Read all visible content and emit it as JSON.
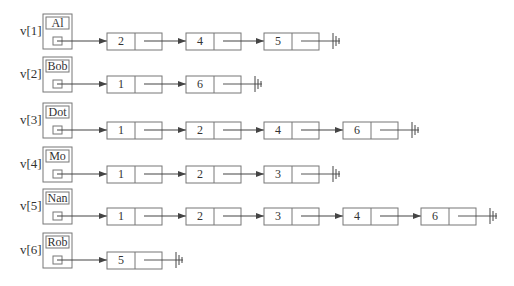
{
  "style": {
    "line_color": "#444444",
    "box_color": "#777777",
    "background": "#ffffff"
  },
  "rows": [
    {
      "label": "v[1]",
      "name": "Al",
      "list": [
        "2",
        "4",
        "5"
      ]
    },
    {
      "label": "v[2]",
      "name": "Bob",
      "list": [
        "1",
        "6"
      ]
    },
    {
      "label": "v[3]",
      "name": "Dot",
      "list": [
        "1",
        "2",
        "4",
        "6"
      ]
    },
    {
      "label": "v[4]",
      "name": "Mo",
      "list": [
        "1",
        "2",
        "3"
      ]
    },
    {
      "label": "v[5]",
      "name": "Nan",
      "list": [
        "1",
        "2",
        "3",
        "4",
        "6"
      ]
    },
    {
      "label": "v[6]",
      "name": "Rob",
      "list": [
        "5"
      ]
    }
  ],
  "null_terminator_icon": "ground-icon"
}
